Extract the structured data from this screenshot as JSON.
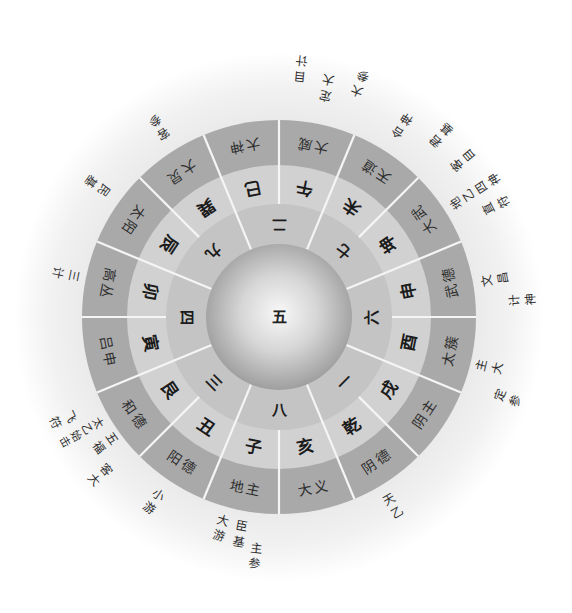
{
  "wheel": {
    "center": "五",
    "palaces": [
      "二",
      "七",
      "六",
      "一",
      "八",
      "三",
      "四",
      "九"
    ],
    "branches": [
      "巳",
      "午",
      "未",
      "坤",
      "申",
      "酉",
      "戌",
      "乾",
      "亥",
      "子",
      "丑",
      "艮",
      "寅",
      "卯",
      "辰",
      "巽"
    ],
    "spirits": [
      "大神",
      "大威",
      "天道",
      "大武",
      "武德",
      "太簇",
      "阴主",
      "阴德",
      "大义",
      "地主",
      "阳德",
      "和德",
      "吕申",
      "高丛",
      "太阳",
      "大炅"
    ]
  },
  "outer_labels": [
    "客参",
    "民基",
    "三计",
    "飞符",
    "太乙始击",
    "五福",
    "客大",
    "小游",
    "大游",
    "臣基",
    "主参",
    "天乙",
    "定参",
    "主大",
    "计神",
    "文昌",
    "直符",
    "地乙四神",
    "客目",
    "君基",
    "合神",
    "大参",
    "定大",
    "目计"
  ],
  "colors": {
    "outer_ring": "#a9a9a9",
    "middle_ring": "#d1d1d1",
    "inner_ring": "#c4c4c4",
    "divider": "#f5f5f5"
  }
}
